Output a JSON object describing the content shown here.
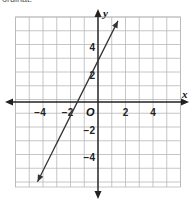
{
  "header": {
    "partial_text": "ordinat."
  },
  "chart_data": {
    "type": "line",
    "title": "",
    "xlabel": "x",
    "ylabel": "y",
    "origin_label": "O",
    "xlim": [
      -6,
      6
    ],
    "ylim": [
      -6,
      6
    ],
    "grid": true,
    "x_tick_labels": [
      "−4",
      "−2",
      "2",
      "4"
    ],
    "x_tick_values": [
      -4,
      -2,
      2,
      4
    ],
    "y_tick_labels": [
      "4",
      "2",
      "−2",
      "−4"
    ],
    "y_tick_values": [
      4,
      2,
      -2,
      -4
    ],
    "series": [
      {
        "name": "line",
        "equation": "y = 2x + 3",
        "slope": 2,
        "intercept": 3,
        "x": [
          -4.4,
          1.45
        ],
        "y": [
          -5.8,
          5.9
        ],
        "arrows_both_ends": true
      }
    ],
    "colors": {
      "grid": "#b8b8b8",
      "axis": "#222222",
      "line": "#333333"
    }
  }
}
